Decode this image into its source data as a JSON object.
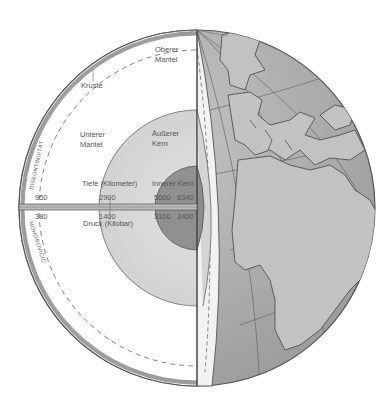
{
  "diagram": {
    "type": "earth-cross-section",
    "labels": {
      "upper_mantle": [
        "Oberer",
        "Mantel"
      ],
      "crust": "Kruste",
      "lower_mantle": [
        "Unterer",
        "Mantel"
      ],
      "outer_core": [
        "Äußerer",
        "Kern"
      ],
      "inner_core": "Innerer Kern",
      "depth_axis": "Tiefe (Kilometer)",
      "pressure_axis": "Druck (Kilobar)",
      "discontinuity": "DISKONTINUITÄT",
      "mohorovicic": "MOHOROVIČIĆ"
    },
    "depth_values_km": [
      "950",
      "2900",
      "5000",
      "6340"
    ],
    "pressure_values_kbar": [
      "380",
      "1400",
      "3100",
      "3400"
    ],
    "colors": {
      "globe_ocean": "#a9a9a9",
      "globe_land": "#c4c4c4",
      "mantle": "#ffffff",
      "outer_core": "#d6d6d6",
      "inner_core": "#8f8f8f",
      "crust": "#bdbdbd",
      "outline": "#555555"
    }
  }
}
